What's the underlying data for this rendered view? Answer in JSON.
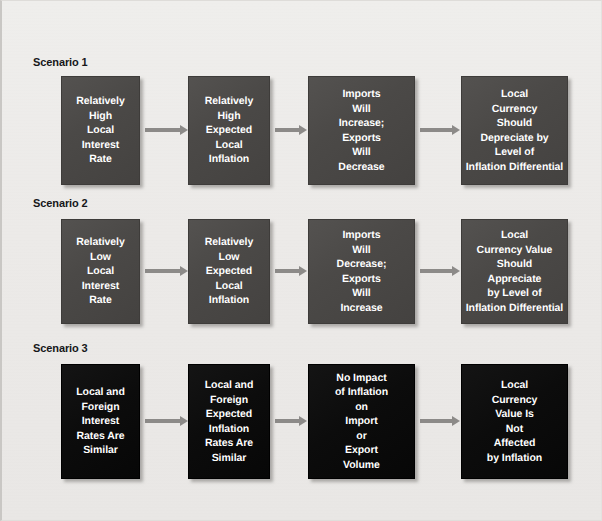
{
  "diagram": {
    "background_color": "#eceae8",
    "box_color_dark": "#4a4846",
    "box_color_black": "#0c0c0c",
    "arrow_color": "#8c8a88",
    "text_color": "#ffffff"
  },
  "scenarios": [
    {
      "label": "Scenario 1",
      "style": "dark",
      "nodes": [
        {
          "text": "Relatively\nHigh\nLocal\nInterest\nRate"
        },
        {
          "text": "Relatively\nHigh\nExpected\nLocal\nInflation"
        },
        {
          "text": "Imports\nWill\nIncrease;\nExports\nWill\nDecrease"
        },
        {
          "text": "Local\nCurrency\nShould\nDepreciate by\nLevel of\nInflation Differential"
        }
      ],
      "arrows": [
        "arrow-1-1",
        "arrow-1-2",
        "arrow-1-3"
      ]
    },
    {
      "label": "Scenario 2",
      "style": "dark",
      "nodes": [
        {
          "text": "Relatively\nLow\nLocal\nInterest\nRate"
        },
        {
          "text": "Relatively\nLow\nExpected\nLocal\nInflation"
        },
        {
          "text": "Imports\nWill\nDecrease;\nExports\nWill\nIncrease"
        },
        {
          "text": "Local\nCurrency Value\nShould\nAppreciate\nby Level of\nInflation Differential"
        }
      ],
      "arrows": [
        "arrow-2-1",
        "arrow-2-2",
        "arrow-2-3"
      ]
    },
    {
      "label": "Scenario 3",
      "style": "black",
      "nodes": [
        {
          "text": "Local and\nForeign\nInterest\nRates Are\nSimilar"
        },
        {
          "text": "Local and\nForeign\nExpected\nInflation\nRates Are\nSimilar"
        },
        {
          "text": "No Impact\nof Inflation\non\nImport\nor\nExport\nVolume"
        },
        {
          "text": "Local\nCurrency\nValue Is\nNot\nAffected\nby Inflation"
        }
      ],
      "arrows": [
        "arrow-3-1",
        "arrow-3-2",
        "arrow-3-3"
      ]
    }
  ]
}
